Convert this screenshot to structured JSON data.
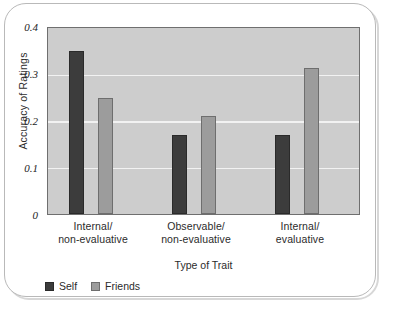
{
  "chart_data": {
    "type": "bar",
    "title": "",
    "xlabel": "Type of Trait",
    "ylabel": "Accuracy of Ratings",
    "ylim": [
      0,
      0.4
    ],
    "yticks": [
      "0",
      "0.1",
      "0.2",
      "0.3",
      "0.4"
    ],
    "ytick_values": [
      0,
      0.1,
      0.2,
      0.3,
      0.4
    ],
    "grid": "horizontal",
    "legend_position": "bottom-left",
    "categories": [
      {
        "line1": "Internal/",
        "line2": "non-evaluative"
      },
      {
        "line1": "Observable/",
        "line2": "non-evaluative"
      },
      {
        "line1": "Internal/",
        "line2": "evaluative"
      }
    ],
    "category_labels": [
      "Internal/ non-evaluative",
      "Observable/ non-evaluative",
      "Internal/ evaluative"
    ],
    "series": [
      {
        "name": "Self",
        "color": "#3c3c3c",
        "values": [
          0.35,
          0.17,
          0.17
        ]
      },
      {
        "name": "Friends",
        "color": "#9c9c9c",
        "values": [
          0.25,
          0.21,
          0.315
        ]
      }
    ]
  },
  "figure": {
    "plot_background": "#cdcdcd",
    "gridline_color": "#f2f2f2",
    "axis_color": "#6f6f6f",
    "frame_color": "#b9b9b9"
  }
}
